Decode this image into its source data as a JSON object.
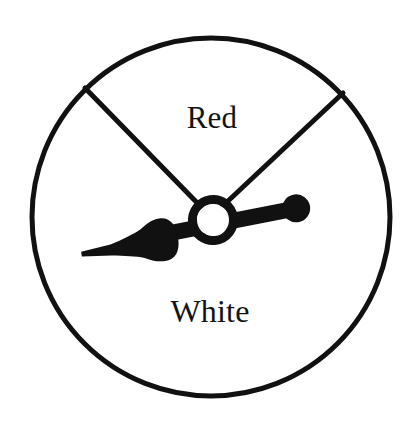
{
  "figure": {
    "kind": "probability-spinner",
    "background_color": "#ffffff",
    "ink_color": "#111111"
  },
  "circle": {
    "center_x": 211,
    "center_y": 217,
    "radius": 179,
    "stroke_width": 5,
    "stroke_color": "#111111",
    "fill_color": "#ffffff"
  },
  "sectors": [
    {
      "label": "Red",
      "label_x": 212,
      "label_y": 118,
      "font_size": 31,
      "start_angle_deg": 215,
      "end_angle_deg": 321,
      "sweep_deg": 106,
      "fill_color": "#ffffff"
    },
    {
      "label": "White",
      "label_x": 210,
      "label_y": 311,
      "font_size": 32,
      "start_angle_deg": 321,
      "end_angle_deg": 575,
      "sweep_deg": 254,
      "fill_color": "#ffffff"
    }
  ],
  "divider_lines": [
    {
      "name": "left-divider",
      "from_x": 211,
      "from_y": 217,
      "to_x": 85,
      "to_y": 88,
      "stroke_width": 5
    },
    {
      "name": "right-divider",
      "from_x": 211,
      "from_y": 217,
      "to_x": 343,
      "to_y": 93,
      "stroke_width": 5
    }
  ],
  "needle": {
    "tilt_deg": -8,
    "pointer_tip_x": 82,
    "pointer_tip_y": 240,
    "tail_ball_x": 297,
    "tail_ball_y": 208,
    "tail_ball_radius": 14,
    "shaft_thickness": 15,
    "fill_color": "#111111"
  },
  "hub": {
    "center_x": 213,
    "center_y": 220,
    "outer_radius": 25,
    "inner_radius": 16,
    "ring_color": "#111111",
    "hole_color": "#ffffff"
  }
}
